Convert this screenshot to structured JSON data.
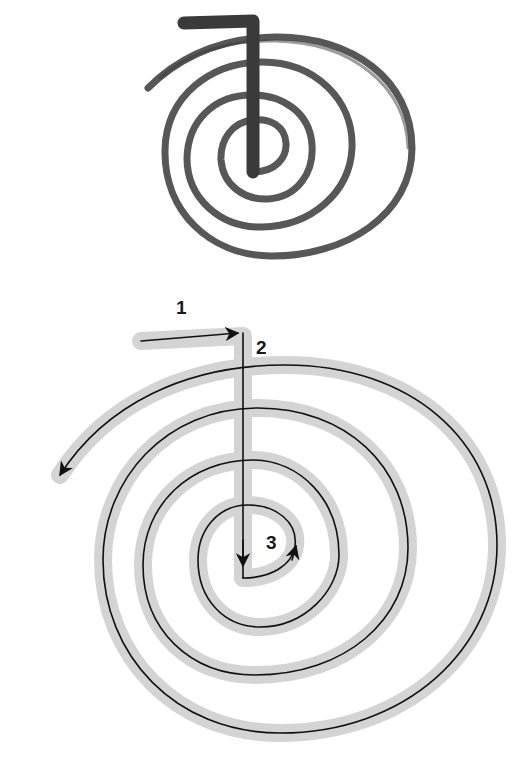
{
  "diagram": {
    "upper_symbol": {
      "description": "Brush-painted spiral symbol with top-left hook",
      "stroke_color": "#3a3a3a"
    },
    "lower_symbol": {
      "description": "Stroke-order guide: gray band with black directional lines",
      "band_color": "#d2d2d2",
      "line_color": "#111111",
      "steps": [
        {
          "number": "1",
          "description": "Horizontal stroke left to right"
        },
        {
          "number": "2",
          "description": "Vertical stroke downward"
        },
        {
          "number": "3",
          "description": "Spiral outward counter-clockwise, ending at left with arrow"
        }
      ]
    }
  }
}
